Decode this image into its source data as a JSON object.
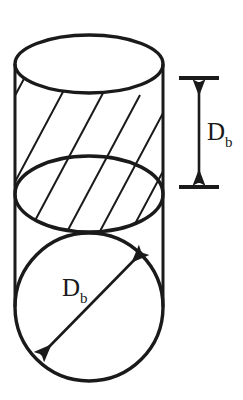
{
  "figure": {
    "kind": "engineering-diagram",
    "background_color": "#ffffff",
    "line_color": "#1a1a1a",
    "width": 243,
    "height": 400
  },
  "labels": {
    "height_dimension": {
      "symbol": "D",
      "subscript": "b"
    },
    "diameter_dimension": {
      "symbol": "D",
      "subscript": "b"
    }
  },
  "geometry": {
    "cylinder": {
      "left_wall_x": 15,
      "right_wall_x": 163,
      "top_ellipse": {
        "cx": 89,
        "cy": 64,
        "rx": 74,
        "ry": 29
      },
      "mid_ellipse": {
        "cx": 89,
        "cy": 194,
        "rx": 74,
        "ry": 38
      },
      "bottom_arc": {
        "cx": 89,
        "cy": 307,
        "r": 74
      }
    },
    "hatch_band": {
      "top_boundary": "top-ellipse",
      "bottom_boundary": "mid-ellipse",
      "line_count": 8,
      "angle_deg": 62
    },
    "particle_circle": {
      "cx": 89,
      "cy": 307,
      "r": 74
    },
    "diameter_arrow": {
      "from_x": 41,
      "from_y": 355,
      "to_x": 142,
      "to_y": 252,
      "double_headed": true
    },
    "height_dimension_line": {
      "x": 199,
      "top_y": 78,
      "bottom_y": 187,
      "tick_half_width": 20,
      "double_headed": true
    }
  }
}
